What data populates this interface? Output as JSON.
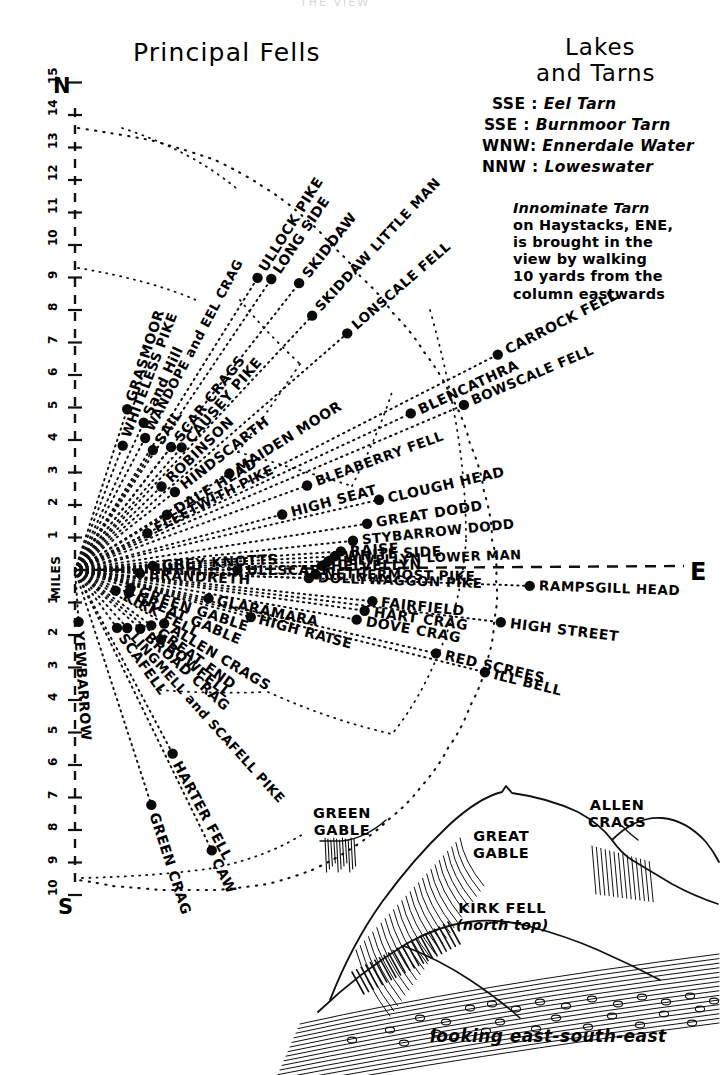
{
  "page": {
    "top_faint_text": "THE VIEW",
    "titles": {
      "principal_fells": "Principal Fells",
      "lakes_line1": "Lakes",
      "lakes_line2": "and Tarns"
    },
    "compass": {
      "north": "N",
      "south": "S",
      "east": "E"
    },
    "scale_label": "MILES",
    "scale_north_ticks": [
      "15",
      "14",
      "13",
      "12",
      "11",
      "10",
      "9",
      "8",
      "7",
      "6",
      "5",
      "4",
      "3",
      "2",
      "1"
    ],
    "scale_south_ticks": [
      "1",
      "2",
      "3",
      "4",
      "5",
      "6",
      "7",
      "8",
      "9",
      "10"
    ]
  },
  "lakes_and_tarns": {
    "entries": [
      {
        "bearing": "SSE",
        "name": "Eel Tarn"
      },
      {
        "bearing": "SSE",
        "name": "Burnmoor Tarn"
      },
      {
        "bearing": "WNW",
        "name": "Ennerdale Water"
      },
      {
        "bearing": "NNW",
        "name": "Loweswater"
      }
    ],
    "note": [
      "Innominate Tarn",
      "on Haystacks, ENE,",
      "is brought in the",
      "view by walking",
      "10 yards from the",
      "column eastwards"
    ]
  },
  "panorama": {
    "labels": [
      {
        "text": "GREEN",
        "sub": "GABLE"
      },
      {
        "text": "GREAT",
        "sub": "GABLE"
      },
      {
        "text": "ALLEN",
        "sub": "CRAGS"
      },
      {
        "text": "KIRK FELL",
        "sub": "(north top)"
      }
    ],
    "caption": "looking east-south-east"
  },
  "chart_data": {
    "type": "scatter",
    "title": "Principal Fells",
    "xlabel": "compass bearing",
    "ylabel": "distance (miles)",
    "origin": {
      "x": 75,
      "y": 570
    },
    "axis_ranges": {
      "miles_north": [
        1,
        15
      ],
      "miles_south": [
        1,
        10
      ]
    },
    "grid": false,
    "legend": "none",
    "fells": [
      {
        "name": "GRASMOOR",
        "angle": -72,
        "dist": 5.2
      },
      {
        "name": "WHITELESS PIKE",
        "angle": -69,
        "dist": 4.1
      },
      {
        "name": "Sand Hill",
        "angle": -65,
        "dist": 5.0
      },
      {
        "name": "WANDOPE and EEL CRAG",
        "angle": -62,
        "dist": 4.6
      },
      {
        "name": "SAIL",
        "angle": -57,
        "dist": 4.4
      },
      {
        "name": "SCAR CRAGS",
        "angle": -52,
        "dist": 4.8
      },
      {
        "name": "CAUSEY PIKE",
        "angle": -49,
        "dist": 5.0
      },
      {
        "name": "ROBINSON",
        "angle": -44,
        "dist": 3.7
      },
      {
        "name": "HINDSCARTH",
        "angle": -38,
        "dist": 3.9
      },
      {
        "name": "DALE HEAD",
        "angle": -31,
        "dist": 3.3
      },
      {
        "name": "FLEETWITH PIKE",
        "angle": -27,
        "dist": 2.5
      },
      {
        "name": "MAIDEN MOOR",
        "angle": -32,
        "dist": 5.6
      },
      {
        "name": "ULLOCK PIKE",
        "angle": -58,
        "dist": 10.6
      },
      {
        "name": "LONG SIDE",
        "angle": -56,
        "dist": 10.8
      },
      {
        "name": "SKIDDAW",
        "angle": -52,
        "dist": 11.2
      },
      {
        "name": "SKIDDAW LITTLE MAN",
        "angle": -47,
        "dist": 10.7
      },
      {
        "name": "LONSCALE FELL",
        "angle": -41,
        "dist": 11.1
      },
      {
        "name": "CARROCK FELL",
        "angle": -27,
        "dist": 14.6
      },
      {
        "name": "BOWSCALE FELL",
        "angle": -23,
        "dist": 13.0
      },
      {
        "name": "BLENCATHRA",
        "angle": -25,
        "dist": 11.4
      },
      {
        "name": "BLEABERRY FELL",
        "angle": -20,
        "dist": 7.6
      },
      {
        "name": "CLOUGH HEAD",
        "angle": -13,
        "dist": 9.6
      },
      {
        "name": "HIGH SEAT",
        "angle": -15,
        "dist": 6.6
      },
      {
        "name": "GREAT DODD",
        "angle": -9,
        "dist": 9.1
      },
      {
        "name": "STYBARROW DODD",
        "angle": -6,
        "dist": 8.6
      },
      {
        "name": "RAISE",
        "angle": -4,
        "dist": 8.2
      },
      {
        "name": "WHITE SIDE",
        "angle": -3,
        "dist": 8.0
      },
      {
        "name": "HELVELLYN LOWER MAN",
        "angle": -2,
        "dist": 7.8
      },
      {
        "name": "HELVELLYN",
        "angle": -1,
        "dist": 7.6
      },
      {
        "name": "NETHERMOST PIKE",
        "angle": 1,
        "dist": 7.4
      },
      {
        "name": "DOLLYWAGGON PIKE",
        "angle": 2,
        "dist": 7.2
      },
      {
        "name": "GREY KNOTTS",
        "angle": -3,
        "dist": 2.4
      },
      {
        "name": "ULLSCARF",
        "angle": 0,
        "dist": 5.0
      },
      {
        "name": "BRANDRETH",
        "angle": 3,
        "dist": 2.0
      },
      {
        "name": "RAMPSGILL HEAD",
        "angle": 2,
        "dist": 14.0
      },
      {
        "name": "FAIRFIELD",
        "angle": 6,
        "dist": 9.2
      },
      {
        "name": "HART CRAG",
        "angle": 8,
        "dist": 9.0
      },
      {
        "name": "HIGH STREET",
        "angle": 7,
        "dist": 13.2
      },
      {
        "name": "DOVE CRAG",
        "angle": 10,
        "dist": 8.8
      },
      {
        "name": "RED SCREES",
        "angle": 13,
        "dist": 11.4
      },
      {
        "name": "ILL BELL",
        "angle": 14,
        "dist": 13.0
      },
      {
        "name": "GLARAMARA",
        "angle": 12,
        "dist": 4.2
      },
      {
        "name": "HIGH RAISE",
        "angle": 15,
        "dist": 5.6
      },
      {
        "name": "GREEN GABLE",
        "angle": 18,
        "dist": 1.8
      },
      {
        "name": "GREAT GABLE",
        "angle": 23,
        "dist": 1.8
      },
      {
        "name": "KIRK FELL",
        "angle": 27,
        "dist": 1.4
      },
      {
        "name": "ALLEN CRAGS",
        "angle": 31,
        "dist": 3.2
      },
      {
        "name": "GREAT END",
        "angle": 36,
        "dist": 2.9
      },
      {
        "name": "BROAD CRAG",
        "angle": 42,
        "dist": 2.7
      },
      {
        "name": "BOWFELL",
        "angle": 39,
        "dist": 3.4
      },
      {
        "name": "LINGMELL and SCAFELL PIKE",
        "angle": 48,
        "dist": 2.4
      },
      {
        "name": "SCAFELL",
        "angle": 54,
        "dist": 2.2
      },
      {
        "name": "YEWBARROW",
        "angle": 86,
        "dist": 1.6
      },
      {
        "name": "HARTER FELL",
        "angle": 62,
        "dist": 6.4
      },
      {
        "name": "CAW",
        "angle": 64,
        "dist": 9.6
      },
      {
        "name": "GREEN CRAG",
        "angle": 72,
        "dist": 7.6
      }
    ]
  }
}
